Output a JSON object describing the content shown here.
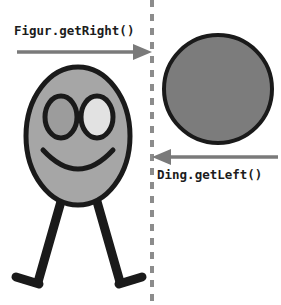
{
  "diagram": {
    "background_color": "#ffffff",
    "width": 281,
    "height": 305
  },
  "divider": {
    "name": "dashed-boundary-line",
    "color": "#8c8c8c",
    "x": 152,
    "stroke_width": 4,
    "dash_on": 7,
    "dash_off": 7,
    "y_start": 0,
    "y_end": 305
  },
  "arrows": [
    {
      "id": "arrow-get-right",
      "label": "Figur.getRight()",
      "direction": "right",
      "color": "#7a7a7a",
      "x_start": 17,
      "x_end": 152,
      "y": 52,
      "label_x": 14,
      "label_y": 25
    },
    {
      "id": "arrow-get-left",
      "label": "Ding.getLeft()",
      "direction": "left",
      "color": "#7a7a7a",
      "x_start": 278,
      "x_end": 152,
      "y": 157,
      "label_x": 157,
      "label_y": 169
    }
  ],
  "figure": {
    "name": "stick-figure-Figur",
    "head": {
      "fill": "#a6a6a6",
      "stroke": "#1a1a1a",
      "stroke_width": 5,
      "cx": 78,
      "cy": 136,
      "rx": 52,
      "ry": 69
    },
    "eyes": [
      {
        "name": "left-eye",
        "fill": "#9c9c9c",
        "stroke": "#1a1a1a",
        "stroke_width": 5,
        "cx": 61,
        "cy": 117,
        "rx": 16,
        "ry": 21
      },
      {
        "name": "right-eye",
        "fill": "#e2e2e2",
        "stroke": "#1a1a1a",
        "stroke_width": 5,
        "cx": 97,
        "cy": 117,
        "rx": 16,
        "ry": 21
      }
    ],
    "mouth": {
      "name": "smile",
      "stroke": "#1a1a1a",
      "stroke_width": 5
    },
    "legs": [
      {
        "name": "left-leg",
        "stroke": "#1a1a1a",
        "stroke_width": 9,
        "x1": 62,
        "y1": 198,
        "x2": 38,
        "y2": 282
      },
      {
        "name": "right-leg",
        "stroke": "#1a1a1a",
        "stroke_width": 9,
        "x1": 96,
        "y1": 198,
        "x2": 120,
        "y2": 282
      }
    ],
    "feet": [
      {
        "name": "left-foot",
        "stroke": "#1a1a1a",
        "stroke_width": 9,
        "x1": 38,
        "y1": 283,
        "x2": 16,
        "y2": 278
      },
      {
        "name": "right-foot",
        "stroke": "#1a1a1a",
        "stroke_width": 9,
        "x1": 120,
        "y1": 283,
        "x2": 141,
        "y2": 278
      }
    ]
  },
  "thing": {
    "name": "circle-Ding",
    "fill": "#7c7c7c",
    "stroke": "#1a1a1a",
    "stroke_width": 4,
    "cx": 218,
    "cy": 89,
    "r": 54
  }
}
